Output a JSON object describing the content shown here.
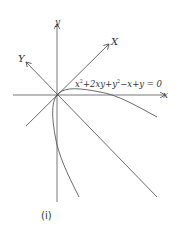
{
  "diagram": {
    "axes": {
      "x_label": "x",
      "y_label": "y",
      "X_label": "X",
      "Y_label": "Y"
    },
    "equation": {
      "parts": [
        "x",
        "2",
        "+2xy+y",
        "2",
        "−x+y = 0"
      ]
    },
    "caption": "(i)",
    "colors": {
      "line": "#444444",
      "background": "#ffffff"
    }
  }
}
